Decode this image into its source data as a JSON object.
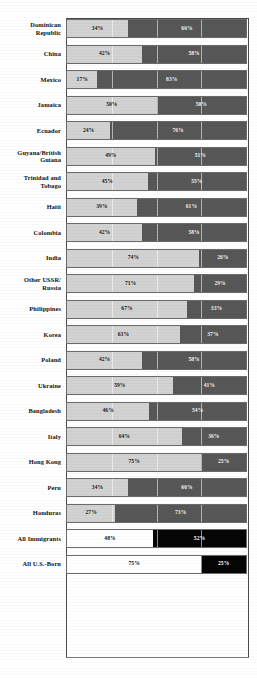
{
  "chart_data": {
    "type": "bar",
    "title": "",
    "subtitle": "",
    "xlabel": "",
    "ylabel": "",
    "orientation": "horizontal",
    "stacked": true,
    "normalized_percent": true,
    "xlim": [
      0,
      100
    ],
    "xticks": [
      0,
      25,
      50,
      75,
      100
    ],
    "grid": true,
    "legend": "none",
    "series": [
      {
        "name": "light-segment",
        "color": "#d2d2d2"
      },
      {
        "name": "dark-segment",
        "color": "#575757"
      }
    ],
    "summary_series": [
      {
        "name": "light-segment",
        "color": "#ffffff"
      },
      {
        "name": "dark-segment",
        "color": "#050505"
      }
    ],
    "categories": [
      "Dominican Republic",
      "China",
      "Mexico",
      "Jamaica",
      "Ecuador",
      "Guyana/British Guiana",
      "Trinidad and Tobago",
      "Haiti",
      "Colombia",
      "India",
      "Other USSR/ Russia",
      "Philippines",
      "Korea",
      "Poland",
      "Ukraine",
      "Bangladesh",
      "Italy",
      "Hong Kong",
      "Peru",
      "Honduras",
      "All Immigrants",
      "All U.S.-Born"
    ],
    "rows": [
      {
        "label_lines": [
          "Dominican",
          "Republic"
        ],
        "left": 34,
        "right": 66,
        "left_text": "34%",
        "right_text": "66%",
        "style": "standard"
      },
      {
        "label_lines": [
          "China"
        ],
        "left": 42,
        "right": 58,
        "left_text": "42%",
        "right_text": "58%",
        "style": "standard"
      },
      {
        "label_lines": [
          "Mexico"
        ],
        "left": 17,
        "right": 83,
        "left_text": "17%",
        "right_text": "83%",
        "style": "standard"
      },
      {
        "label_lines": [
          "Jamaica"
        ],
        "left": 50,
        "right": 50,
        "left_text": "50%",
        "right_text": "50%",
        "style": "standard"
      },
      {
        "label_lines": [
          "Ecuador"
        ],
        "left": 24,
        "right": 76,
        "left_text": "24%",
        "right_text": "76%",
        "style": "standard"
      },
      {
        "label_lines": [
          "Guyana/British",
          "Guiana"
        ],
        "left": 49,
        "right": 51,
        "left_text": "49%",
        "right_text": "51%",
        "style": "standard"
      },
      {
        "label_lines": [
          "Trinidad and",
          "Tobago"
        ],
        "left": 45,
        "right": 55,
        "left_text": "45%",
        "right_text": "55%",
        "style": "standard"
      },
      {
        "label_lines": [
          "Haiti"
        ],
        "left": 39,
        "right": 61,
        "left_text": "39%",
        "right_text": "61%",
        "style": "standard"
      },
      {
        "label_lines": [
          "Colombia"
        ],
        "left": 42,
        "right": 58,
        "left_text": "42%",
        "right_text": "58%",
        "style": "standard"
      },
      {
        "label_lines": [
          "India"
        ],
        "left": 74,
        "right": 26,
        "left_text": "74%",
        "right_text": "26%",
        "style": "standard"
      },
      {
        "label_lines": [
          "Other USSR/",
          "Russia"
        ],
        "left": 71,
        "right": 29,
        "left_text": "71%",
        "right_text": "29%",
        "style": "standard"
      },
      {
        "label_lines": [
          "Philippines"
        ],
        "left": 67,
        "right": 33,
        "left_text": "67%",
        "right_text": "33%",
        "style": "standard"
      },
      {
        "label_lines": [
          "Korea"
        ],
        "left": 63,
        "right": 37,
        "left_text": "63%",
        "right_text": "37%",
        "style": "standard"
      },
      {
        "label_lines": [
          "Poland"
        ],
        "left": 42,
        "right": 58,
        "left_text": "42%",
        "right_text": "58%",
        "style": "standard"
      },
      {
        "label_lines": [
          "Ukraine"
        ],
        "left": 59,
        "right": 41,
        "left_text": "59%",
        "right_text": "41%",
        "style": "standard"
      },
      {
        "label_lines": [
          "Bangladesh"
        ],
        "left": 46,
        "right": 54,
        "left_text": "46%",
        "right_text": "54%",
        "style": "standard"
      },
      {
        "label_lines": [
          "Italy"
        ],
        "left": 64,
        "right": 36,
        "left_text": "64%",
        "right_text": "36%",
        "style": "standard"
      },
      {
        "label_lines": [
          "Hong Kong"
        ],
        "left": 75,
        "right": 25,
        "left_text": "75%",
        "right_text": "25%",
        "style": "standard"
      },
      {
        "label_lines": [
          "Peru"
        ],
        "left": 34,
        "right": 66,
        "left_text": "34%",
        "right_text": "66%",
        "style": "standard"
      },
      {
        "label_lines": [
          "Honduras"
        ],
        "left": 27,
        "right": 73,
        "left_text": "27%",
        "right_text": "73%",
        "style": "standard"
      },
      {
        "label_lines": [
          "All Immigrants"
        ],
        "left": 48,
        "right": 52,
        "left_text": "48%",
        "right_text": "52%",
        "style": "summary"
      },
      {
        "label_lines": [
          "All U.S.-Born"
        ],
        "left": 75,
        "right": 25,
        "left_text": "75%",
        "right_text": "25%",
        "style": "summary"
      }
    ]
  }
}
